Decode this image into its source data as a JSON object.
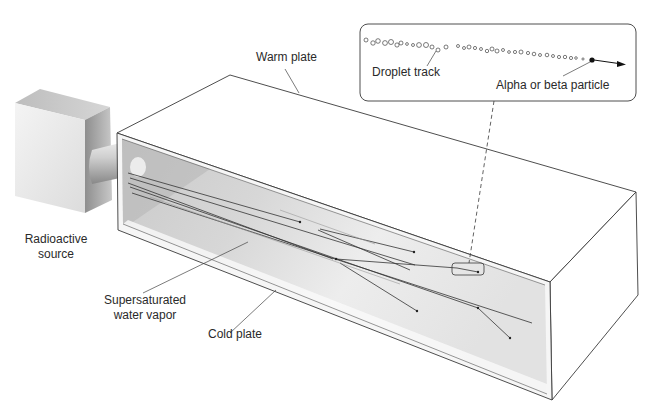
{
  "diagram": {
    "labels": {
      "warm_plate": "Warm plate",
      "cold_plate": "Cold plate",
      "radioactive_source_line1": "Radioactive",
      "radioactive_source_line2": "source",
      "vapor_line1": "Supersaturated",
      "vapor_line2": "water vapor",
      "droplet_track": "Droplet track",
      "particle": "Alpha or beta particle"
    },
    "colors": {
      "line": "#3a3a3a",
      "chamber_shadow": "#bdbdbd",
      "chamber_light": "#efefef",
      "background": "#ffffff"
    }
  }
}
